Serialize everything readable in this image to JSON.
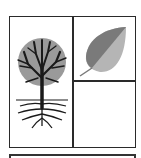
{
  "figure": {
    "layout": "grid",
    "cells": [
      {
        "position": "left",
        "icon": "tree-with-roots-icon"
      },
      {
        "position": "top-right",
        "icon": "leaf-icon"
      },
      {
        "position": "bottom-right",
        "icon": null
      }
    ],
    "colors": {
      "border": "#2a2a2a",
      "canopy": "#9a9a9a",
      "branches": "#1a1a1a",
      "leaf_dark": "#7a7a7a",
      "leaf_light": "#b5b5b5"
    }
  }
}
